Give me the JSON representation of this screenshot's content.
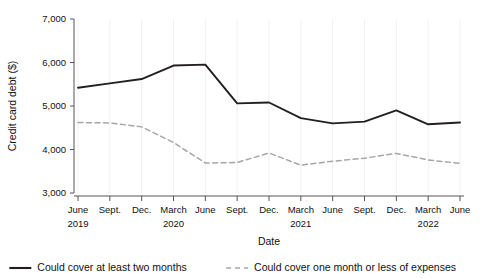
{
  "chart_data": {
    "type": "line",
    "title": "",
    "xlabel": "Date",
    "ylabel": "Credit card debt ($)",
    "ylim": [
      3000,
      7000
    ],
    "y_ticks": [
      3000,
      4000,
      5000,
      6000,
      7000
    ],
    "y_tick_labels": [
      "3,000",
      "4,000",
      "5,000",
      "6,000",
      "7,000"
    ],
    "grid": true,
    "grid_axis": "x",
    "legend_position": "bottom",
    "categories": [
      "June 2019",
      "Sept. 2019",
      "Dec. 2019",
      "March 2020",
      "June 2020",
      "Sept. 2020",
      "Dec. 2020",
      "March 2021",
      "June 2021",
      "Sept. 2021",
      "Dec. 2021",
      "March 2022",
      "June 2022"
    ],
    "x_tick_labels": [
      "June",
      "Sept.",
      "Dec.",
      "March",
      "June",
      "Sept.",
      "Dec.",
      "March",
      "June",
      "Sept.",
      "Dec.",
      "March",
      "June"
    ],
    "x_year_labels": [
      {
        "index": 0,
        "label": "2019"
      },
      {
        "index": 3,
        "label": "2020"
      },
      {
        "index": 7,
        "label": "2021"
      },
      {
        "index": 11,
        "label": "2022"
      }
    ],
    "series": [
      {
        "name": "Could cover at least two months",
        "style": "solid",
        "color": "#231f20",
        "values": [
          5420,
          5520,
          5620,
          5930,
          5950,
          5060,
          5080,
          4720,
          4600,
          4640,
          4900,
          4580,
          4620
        ]
      },
      {
        "name": "Could cover one month or less of expenses",
        "style": "dashed",
        "color": "#a6a6a6",
        "values": [
          4620,
          4610,
          4520,
          4160,
          3690,
          3700,
          3920,
          3640,
          3730,
          3800,
          3910,
          3760,
          3680
        ]
      }
    ]
  },
  "legend": {
    "items": [
      {
        "label": "Could cover at least two months",
        "style": "solid",
        "color": "#231f20"
      },
      {
        "label": "Could cover one month or less of expenses",
        "style": "dashed",
        "color": "#a6a6a6"
      }
    ]
  }
}
